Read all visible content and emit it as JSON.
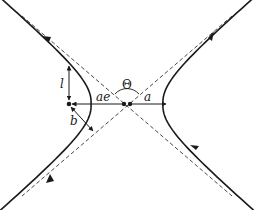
{
  "diagram": {
    "labels": {
      "semi_latus_rectum": "l",
      "focus_distance": "ae",
      "semi_major_axis": "a",
      "impact_parameter": "b",
      "asymptote_angle": "Θ"
    },
    "elements": {
      "asymptotes": 2,
      "hyperbola_branches": 2,
      "focus_points": 1,
      "center_points": 1
    },
    "colors": {
      "stroke": "#1a1a1a",
      "background": "#ffffff"
    }
  }
}
